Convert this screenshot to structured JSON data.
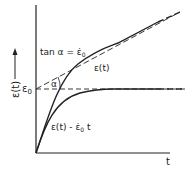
{
  "diagram": {
    "y_axis_label": "ε(t)",
    "x_axis_label": "t",
    "epsilon0_label": "ε",
    "epsilon0_sub": "0",
    "tan_label": "tan α = ε̇",
    "tan_sub": "0",
    "alpha_label": "α",
    "curve1_label": "ε(t)",
    "curve2_label": "ε(t) - ε̇",
    "curve2_sub": "0",
    "curve2_suffix": " t",
    "colors": {
      "line": "#222222",
      "background": "#ffffff"
    }
  }
}
